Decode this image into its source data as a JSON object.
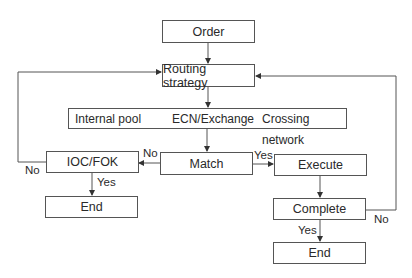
{
  "nodes": {
    "order": "Order",
    "routing": "Routing strategy",
    "sources": [
      "Internal pool",
      "ECN/Exchange",
      "Crossing network"
    ],
    "match": "Match",
    "ioc_fok": "IOC/FOK",
    "execute": "Execute",
    "complete": "Complete",
    "end_left": "End",
    "end_right": "End"
  },
  "edge_labels": {
    "match_no": "No",
    "match_yes": "Yes",
    "ioc_yes": "Yes",
    "ioc_no": "No",
    "complete_yes": "Yes",
    "complete_no": "No"
  },
  "colors": {
    "line": "#555555",
    "text": "#2a2a2a",
    "background": "#ffffff"
  }
}
